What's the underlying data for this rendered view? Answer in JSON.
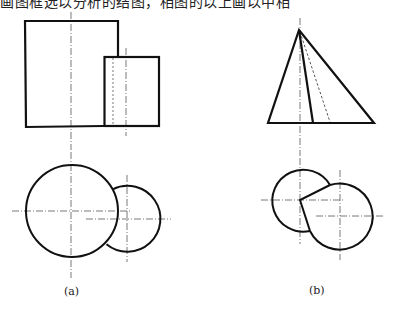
{
  "caption_top": "画图框选以分析的结图，相图的以上画以中相",
  "figures": [
    {
      "id": "a",
      "label": "(a)",
      "front_view": {
        "large_square": {
          "x": 25,
          "y": 21,
          "w": 93,
          "h": 106
        },
        "small_rect": {
          "x": 104,
          "y": 57,
          "w": 55,
          "h": 69
        },
        "centerlines_x": [
          71,
          126
        ],
        "hidden_line_x": 113
      },
      "top_view": {
        "large_circle": {
          "cx": 72,
          "cy": 211,
          "r": 46
        },
        "small_circle": {
          "cx": 127,
          "cy": 218,
          "r": 33
        }
      }
    },
    {
      "id": "b",
      "label": "(b)",
      "front_view": {
        "triangle": {
          "apex": [
            299,
            30
          ],
          "base_left": [
            268,
            123
          ],
          "base_right": [
            374,
            123
          ]
        },
        "inner_edge_to": [
          313,
          123
        ],
        "hidden_edge_to": [
          330,
          122
        ],
        "centerline_x": 300
      },
      "top_view": {
        "left_circle": {
          "cx": 300,
          "cy": 200,
          "r": 31
        },
        "right_circle": {
          "cx": 341,
          "cy": 216,
          "r": 33
        }
      }
    }
  ],
  "colors": {
    "line": "#111111",
    "centerline": "#444444",
    "background": "#ffffff"
  }
}
